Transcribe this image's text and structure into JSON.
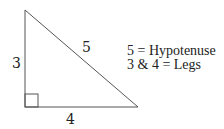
{
  "diagram": {
    "labels": {
      "left_leg": "3",
      "bottom_leg": "4",
      "hypotenuse": "5"
    },
    "legend": [
      "5 = Hypotenuse",
      "3 & 4 = Legs"
    ],
    "colors": {
      "stroke": "#444444",
      "text": "#222222"
    }
  }
}
